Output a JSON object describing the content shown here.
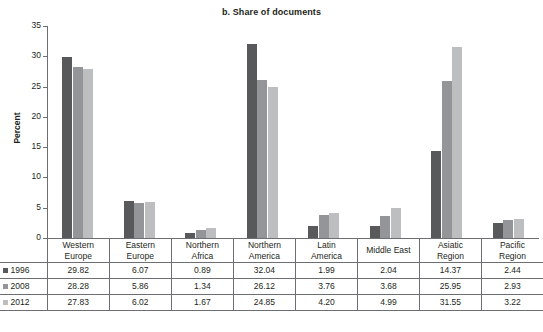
{
  "chart_data": {
    "type": "bar",
    "title": "b. Share of documents",
    "xlabel": "",
    "ylabel": "Percent",
    "ylim": [
      0,
      35
    ],
    "yticks": [
      0,
      5,
      10,
      15,
      20,
      25,
      30,
      35
    ],
    "ytick_labels": [
      "0",
      "5",
      "10",
      "15",
      "20",
      "25",
      "30",
      "35"
    ],
    "grid": false,
    "legend_position": "table-row-headers",
    "categories": [
      "Western Europe",
      "Eastern Europe",
      "Northern Africa",
      "Northern America",
      "Latin America",
      "Middle East",
      "Asiatic Region",
      "Pacific Region"
    ],
    "category_lines": [
      [
        "Western",
        "Europe"
      ],
      [
        "Eastern",
        "Europe"
      ],
      [
        "Northern",
        "Africa"
      ],
      [
        "Northern",
        "America"
      ],
      [
        "Latin",
        "America"
      ],
      [
        "Middle East"
      ],
      [
        "Asiatic",
        "Region"
      ],
      [
        "Pacific",
        "Region"
      ]
    ],
    "series": [
      {
        "name": "1996",
        "color": "#58595b",
        "values": [
          29.82,
          6.07,
          0.89,
          32.04,
          1.99,
          2.04,
          14.37,
          2.44
        ],
        "labels": [
          "29.82",
          "6.07",
          "0.89",
          "32.04",
          "1.99",
          "2.04",
          "14.37",
          "2.44"
        ]
      },
      {
        "name": "2008",
        "color": "#939598",
        "values": [
          28.28,
          5.86,
          1.34,
          26.12,
          3.76,
          3.68,
          25.95,
          2.93
        ],
        "labels": [
          "28.28",
          "5.86",
          "1.34",
          "26.12",
          "3.76",
          "3.68",
          "25.95",
          "2.93"
        ]
      },
      {
        "name": "2012",
        "color": "#bcbec0",
        "values": [
          27.83,
          6.02,
          1.67,
          24.85,
          4.2,
          4.99,
          31.55,
          3.22
        ],
        "labels": [
          "27.83",
          "6.02",
          "1.67",
          "24.85",
          "4.20",
          "4.99",
          "31.55",
          "3.22"
        ]
      }
    ]
  },
  "table": {
    "corner_label": ""
  }
}
